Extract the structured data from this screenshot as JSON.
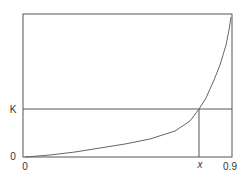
{
  "chart_data": {
    "type": "line",
    "title": "",
    "xlabel": "",
    "ylabel": "",
    "xlim": [
      0,
      0.9
    ],
    "ylim": [
      0,
      null
    ],
    "grid": false,
    "legend": null,
    "x_ticks": [
      "0",
      "x",
      "0.9"
    ],
    "y_ticks": [
      "0",
      "K"
    ],
    "series": [
      {
        "name": "curve",
        "points_px": [
          [
            25,
            157
          ],
          [
            50,
            155
          ],
          [
            75,
            152
          ],
          [
            100,
            148
          ],
          [
            125,
            144
          ],
          [
            150,
            139
          ],
          [
            175,
            131
          ],
          [
            190,
            121
          ],
          [
            199,
            109
          ],
          [
            206,
            98
          ],
          [
            214,
            80
          ],
          [
            220,
            65
          ],
          [
            226,
            45
          ],
          [
            229,
            30
          ],
          [
            231,
            17
          ]
        ]
      }
    ],
    "annotations": [
      {
        "type": "hline",
        "label": "K",
        "from_x_px": 23,
        "to_x_px": 232,
        "y_px": 109
      },
      {
        "type": "vline",
        "label": "x",
        "x_px": 199,
        "from_y_px": 109,
        "to_y_px": 157
      }
    ]
  },
  "labels": {
    "y_zero": "0",
    "y_k": "K",
    "x_zero": "0",
    "x_x": "x",
    "x_max": "0.9"
  },
  "colors": {
    "axis": "#555555",
    "curve": "#666666",
    "text": "#333333"
  }
}
